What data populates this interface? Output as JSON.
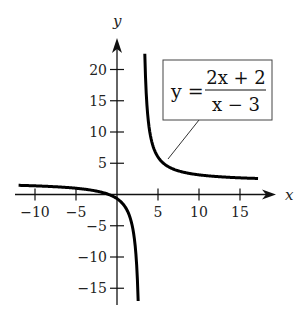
{
  "chart_data": {
    "type": "line",
    "title": "",
    "function": "y = (2x + 2)/(x - 3)",
    "xlabel": "x",
    "ylabel": "y",
    "xlim": [
      -12,
      18
    ],
    "ylim": [
      -17,
      22
    ],
    "x_ticks": [
      -10,
      -5,
      5,
      10,
      15
    ],
    "y_ticks": [
      20,
      15,
      10,
      5,
      -5,
      -10,
      -15
    ],
    "grid": false,
    "vertical_asymptote": 3,
    "horizontal_asymptote": 2,
    "series": [
      {
        "name": "left branch",
        "x": [
          -12,
          -10,
          -8,
          -6,
          -4,
          -2,
          -1,
          0,
          1,
          2,
          2.4,
          2.58
        ],
        "y": [
          1.47,
          1.38,
          1.27,
          1.11,
          0.86,
          0.4,
          0,
          -0.67,
          -2,
          -6,
          -11.33,
          -17.1
        ]
      },
      {
        "name": "right branch",
        "x": [
          3.39,
          3.5,
          4,
          5,
          6,
          8,
          10,
          12,
          15,
          17.2
        ],
        "y": [
          22.5,
          18,
          10,
          6,
          4.67,
          3.6,
          3.14,
          2.89,
          2.67,
          2.56
        ]
      }
    ],
    "annotation": {
      "lhs": "y =",
      "numerator": "2x + 2",
      "denominator": "x − 3",
      "points_to": [
        5.3,
        6.6
      ]
    }
  }
}
